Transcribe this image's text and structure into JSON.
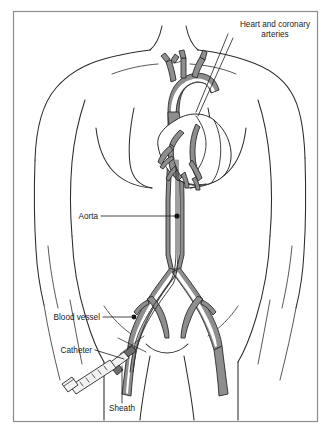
{
  "figure": {
    "background_color": "#ffffff",
    "frame": {
      "name": "figure-border",
      "color": "#8c8c8c",
      "x": 13,
      "y": 11,
      "width": 305,
      "height": 411
    }
  },
  "colors": {
    "outline": "#2b2b2b",
    "vessel_wall": "#8e8e8e",
    "vessel_lumen": "#ffffff",
    "label_text": "#1a1a1a",
    "leader_line": "#1a1a1a",
    "device_body": "#f2f2f2",
    "device_dark": "#6e6e6e"
  },
  "labels": [
    {
      "id": "heart-and-coronary-arteries",
      "lines": [
        "Heart and coronary",
        "arteries"
      ],
      "line1": "Heart and coronary",
      "line2": "arteries",
      "align": "center",
      "x": 275,
      "y": 27,
      "leader_target_x": 198,
      "leader_target_y": 116
    },
    {
      "id": "aorta",
      "lines": [
        "Aorta"
      ],
      "line1": "Aorta",
      "align": "end",
      "x": 98,
      "y": 218,
      "leader_target_x": 178,
      "leader_target_y": 216
    },
    {
      "id": "blood-vessel",
      "lines": [
        "Blood vessel"
      ],
      "line1": "Blood vessel",
      "align": "end",
      "x": 100,
      "y": 320,
      "leader_target_x": 134,
      "leader_target_y": 319
    },
    {
      "id": "catheter",
      "lines": [
        "Catheter"
      ],
      "line1": "Catheter",
      "align": "end",
      "x": 92,
      "y": 352,
      "leader_target_x": 125,
      "leader_target_y": 356
    },
    {
      "id": "sheath",
      "lines": [
        "Sheath"
      ],
      "line1": "Sheath",
      "align": "middle",
      "x": 122,
      "y": 411,
      "leader_target_x": 122,
      "leader_target_y": 362
    }
  ],
  "anatomy": {
    "parts": [
      "torso outline",
      "shoulders",
      "clavicles",
      "pectoral muscles",
      "abdomen",
      "hip / groin",
      "aortic arch",
      "brachiocephalic branches",
      "descending aorta",
      "abdominal aorta",
      "iliac bifurcation",
      "femoral arteries",
      "heart",
      "coronary arteries"
    ]
  },
  "devices": {
    "items": [
      {
        "name": "syringe",
        "description": "syringe barrel with graduation marks and plunger flange"
      },
      {
        "name": "catheter",
        "description": "thin flexible tube advanced into the femoral artery"
      },
      {
        "name": "sheath",
        "description": "introducer sheath at the vessel puncture site"
      }
    ]
  }
}
